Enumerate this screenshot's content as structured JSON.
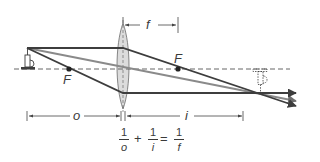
{
  "labels": {
    "focal_length": "f",
    "focal_point_left": "F",
    "focal_point_right": "F",
    "object_distance": "o",
    "image_distance": "i"
  },
  "equation": {
    "term1": {
      "num": "1",
      "den": "o"
    },
    "op1": "+",
    "term2": {
      "num": "1",
      "den": "i"
    },
    "op2": "=",
    "term3": {
      "num": "1",
      "den": "f"
    }
  },
  "colors": {
    "ray_dark": "#3d3d3d",
    "ray_gray": "#8a8a8a",
    "lens_fill": "#d9d9d9",
    "axis": "#555555"
  }
}
